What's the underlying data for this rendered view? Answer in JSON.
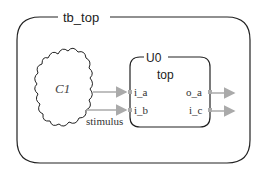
{
  "testbench": {
    "label": "tb_top"
  },
  "cloud": {
    "label": "C1",
    "signal_label": "stimulus"
  },
  "instance": {
    "name": "U0",
    "module": "top",
    "ports_in": [
      "i_a",
      "i_b"
    ],
    "ports_out": [
      "o_a",
      "i_c"
    ]
  },
  "colors": {
    "stroke": "#222222",
    "arrow": "#aaaaaa"
  }
}
